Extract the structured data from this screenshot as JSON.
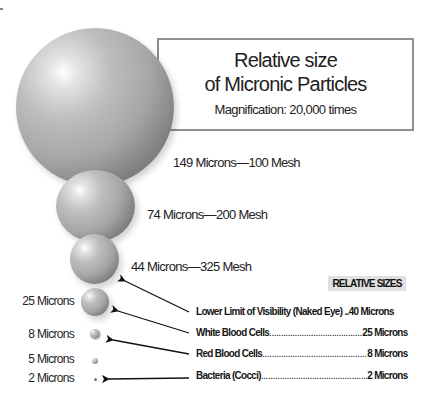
{
  "title_box": {
    "line1": "Relative size",
    "line2": "of Micronic Particles",
    "subtitle": "Magnification: 20,000 times"
  },
  "spheres": [
    {
      "microns": 149,
      "label": "149 Microns—100 Mesh"
    },
    {
      "microns": 74,
      "label": "74 Microns—200 Mesh"
    },
    {
      "microns": 44,
      "label": "44 Microns—325 Mesh"
    },
    {
      "microns": 25,
      "label": "25 Microns"
    },
    {
      "microns": 8,
      "label": "8 Microns"
    },
    {
      "microns": 5,
      "label": "5 Microns"
    },
    {
      "microns": 2,
      "label": "2 Microns"
    }
  ],
  "legend": {
    "heading": "RELATIVE SIZES",
    "rows": [
      {
        "name": "Lower Limit of Visibility (Naked Eye) ..",
        "value": "40 Microns"
      },
      {
        "name": "White Blood Cells ",
        "value": "25 Microns"
      },
      {
        "name": "Red Blood Cells ",
        "value": "8 Microns"
      },
      {
        "name": "Bacteria (Cocci) ",
        "value": "2 Microns"
      }
    ]
  },
  "colors": {
    "sphere_base": "#a6a6a6",
    "box_border": "#8e8e8e",
    "badge_bg": "#e0e0e0"
  }
}
